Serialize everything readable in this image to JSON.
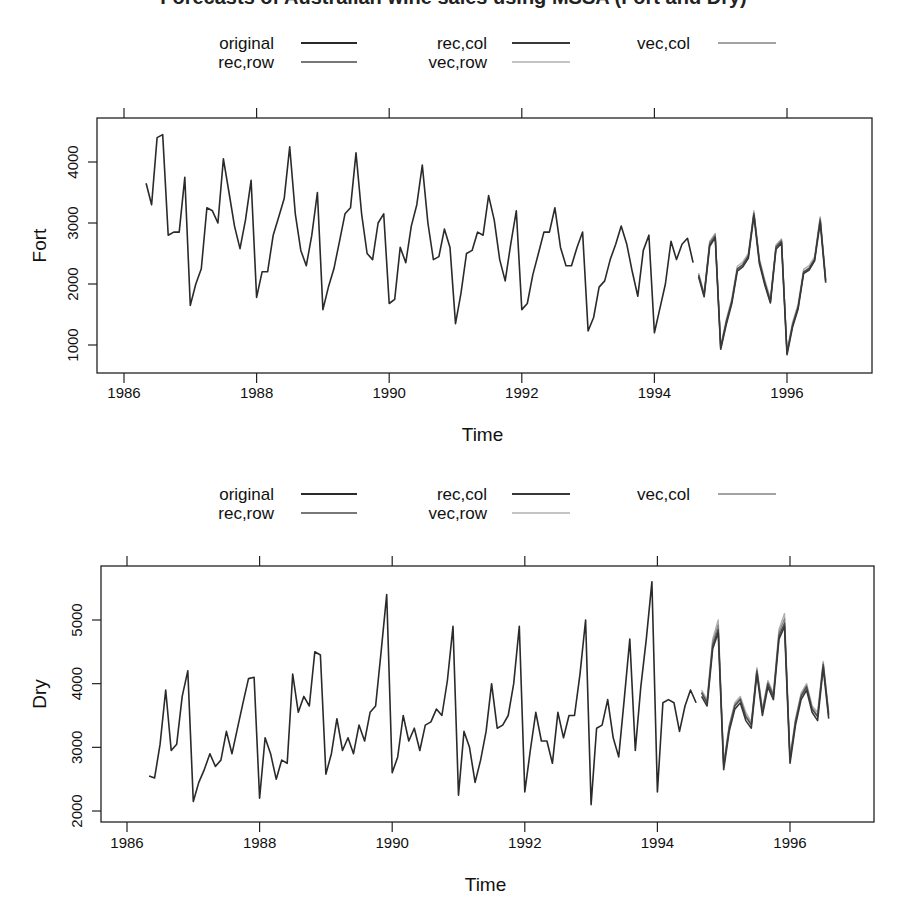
{
  "figure": {
    "title_clipped": "Forecasts of Australian wine sales using MSSA (Fort and Dry)"
  },
  "legend": {
    "entries": [
      {
        "label": "original",
        "color": "#2a2a2a",
        "width": 1.6
      },
      {
        "label": "rec,row",
        "color": "#4a4a4a",
        "width": 1.4
      },
      {
        "label": "rec,col",
        "color": "#383838",
        "width": 1.6
      },
      {
        "label": "vec,row",
        "color": "#b0b0b0",
        "width": 1.4
      },
      {
        "label": "vec,col",
        "color": "#858585",
        "width": 1.4
      }
    ]
  },
  "chart_data": [
    {
      "type": "line",
      "title": "",
      "xlabel": "Time",
      "ylabel": "Fort",
      "xlim": [
        1985.59,
        1997.28
      ],
      "ylim": [
        541,
        4721
      ],
      "x_ticks": [
        1986,
        1988,
        1990,
        1992,
        1994,
        1996
      ],
      "y_ticks": [
        1000,
        2000,
        3000,
        4000
      ],
      "grid": false,
      "legend_position": "top",
      "series": [
        {
          "name": "original",
          "start": 1986.333,
          "step": 0.0833333,
          "values": [
            3650,
            3300,
            4400,
            4450,
            2800,
            2850,
            2850,
            3750,
            1650,
            2000,
            2250,
            3250,
            3200,
            3000,
            4050,
            3500,
            2950,
            2580,
            3050,
            3700,
            1780,
            2200,
            2200,
            2800,
            3100,
            3400,
            4250,
            3150,
            2550,
            2300,
            2800,
            3500,
            1580,
            1950,
            2250,
            2700,
            3150,
            3250,
            4150,
            3150,
            2500,
            2400,
            3000,
            3150,
            1680,
            1750,
            2600,
            2350,
            2950,
            3300,
            3950,
            3000,
            2400,
            2450,
            2900,
            2600,
            1350,
            1850,
            2500,
            2550,
            2850,
            2800,
            3450,
            3050,
            2400,
            2050,
            2650,
            3200,
            1580,
            1680,
            2150,
            2500,
            2850,
            2850,
            3250,
            2600,
            2300,
            2300,
            2600,
            2850,
            1230,
            1450,
            1950,
            2050,
            2400,
            2650,
            2950,
            2650,
            2200,
            1800,
            2550,
            2800,
            1200,
            1600,
            2000,
            2700,
            2400,
            2650,
            2750,
            2350
          ]
        },
        {
          "name": "rec,row",
          "start": 1994.667,
          "step": 0.0833333,
          "values": [
            2150,
            1820,
            2650,
            2780,
            960,
            1380,
            1720,
            2250,
            2320,
            2460,
            3150,
            2380,
            2020,
            1720,
            2600,
            2700,
            870,
            1330,
            1630,
            2200,
            2260,
            2410,
            3050,
            2060
          ]
        },
        {
          "name": "rec,col",
          "start": 1994.667,
          "step": 0.0833333,
          "values": [
            2120,
            1790,
            2620,
            2760,
            930,
            1330,
            1680,
            2210,
            2280,
            2420,
            3120,
            2330,
            1980,
            1690,
            2570,
            2670,
            840,
            1290,
            1590,
            2170,
            2230,
            2380,
            3010,
            2020
          ]
        },
        {
          "name": "vec,row",
          "start": 1994.667,
          "step": 0.0833333,
          "values": [
            2180,
            1850,
            2700,
            2830,
            990,
            1410,
            1760,
            2290,
            2360,
            2500,
            3200,
            2420,
            2060,
            1760,
            2640,
            2740,
            900,
            1370,
            1670,
            2240,
            2300,
            2450,
            3100,
            2100
          ]
        },
        {
          "name": "vec,col",
          "start": 1994.667,
          "step": 0.0833333,
          "values": [
            2140,
            1810,
            2680,
            2810,
            940,
            1360,
            1700,
            2230,
            2300,
            2440,
            3170,
            2360,
            2000,
            1700,
            2620,
            2720,
            860,
            1310,
            1610,
            2190,
            2240,
            2390,
            3080,
            2040
          ]
        }
      ]
    },
    {
      "type": "line",
      "title": "",
      "xlabel": "Time",
      "ylabel": "Dry",
      "xlim": [
        1985.59,
        1997.28
      ],
      "ylim": [
        1827,
        5848
      ],
      "x_ticks": [
        1986,
        1988,
        1990,
        1992,
        1994,
        1996
      ],
      "y_ticks": [
        2000,
        3000,
        4000,
        5000
      ],
      "grid": false,
      "legend_position": "top",
      "series": [
        {
          "name": "original",
          "start": 1986.333,
          "step": 0.0833333,
          "values": [
            2550,
            2520,
            3050,
            3900,
            2950,
            3050,
            3800,
            4200,
            2150,
            2450,
            2650,
            2900,
            2700,
            2800,
            3250,
            2900,
            3300,
            3700,
            4080,
            4100,
            2200,
            3150,
            2900,
            2500,
            2800,
            2750,
            4150,
            3550,
            3800,
            3650,
            4500,
            4450,
            2580,
            2900,
            3450,
            2950,
            3150,
            2900,
            3350,
            3100,
            3550,
            3650,
            4500,
            5400,
            2600,
            2850,
            3500,
            3100,
            3300,
            2950,
            3350,
            3400,
            3600,
            3500,
            4050,
            4900,
            2250,
            3250,
            3000,
            2450,
            2800,
            3250,
            4000,
            3300,
            3350,
            3500,
            4000,
            4900,
            2300,
            2950,
            3550,
            3100,
            3100,
            2750,
            3550,
            3150,
            3500,
            3500,
            4150,
            5000,
            2100,
            3300,
            3350,
            3750,
            3150,
            2850,
            3750,
            4700,
            2950,
            3950,
            4700,
            5600,
            2300,
            3700,
            3750,
            3700,
            3250,
            3650,
            3900,
            3700
          ]
        },
        {
          "name": "rec,row",
          "start": 1994.667,
          "step": 0.0833333,
          "values": [
            3850,
            3700,
            4600,
            4850,
            2700,
            3300,
            3650,
            3750,
            3480,
            3350,
            4200,
            3550,
            4000,
            3800,
            4750,
            4950,
            2800,
            3400,
            3800,
            3950,
            3600,
            3480,
            4300,
            3500
          ]
        },
        {
          "name": "rec,col",
          "start": 1994.667,
          "step": 0.0833333,
          "values": [
            3800,
            3650,
            4550,
            4800,
            2650,
            3250,
            3600,
            3700,
            3420,
            3300,
            4150,
            3500,
            3950,
            3750,
            4700,
            4900,
            2750,
            3350,
            3750,
            3900,
            3550,
            3420,
            4250,
            3450
          ]
        },
        {
          "name": "vec,row",
          "start": 1994.667,
          "step": 0.0833333,
          "values": [
            3900,
            3750,
            4700,
            5000,
            2750,
            3350,
            3700,
            3800,
            3550,
            3400,
            4250,
            3600,
            4050,
            3850,
            4850,
            5100,
            2850,
            3450,
            3850,
            4000,
            3650,
            3550,
            4350,
            3550
          ]
        },
        {
          "name": "vec,col",
          "start": 1994.667,
          "step": 0.0833333,
          "values": [
            3870,
            3720,
            4650,
            4920,
            2720,
            3320,
            3670,
            3770,
            3500,
            3370,
            4220,
            3570,
            4020,
            3820,
            4800,
            5020,
            2820,
            3420,
            3820,
            3970,
            3620,
            3500,
            4320,
            3520
          ]
        }
      ]
    }
  ],
  "panels": [
    {
      "frame": {
        "left": 97,
        "top": 118,
        "right": 872,
        "bottom": 373
      },
      "x_map": {
        "year0": 1986,
        "px0": 124,
        "px_per_year": 66.3
      },
      "y_map": {
        "v0": 4000,
        "py0": 162,
        "px_per_unit": 0.061
      },
      "legend_top": 36,
      "xlabel_y": 441,
      "ticklabel_y": 398,
      "ylabel_x": 46
    },
    {
      "frame": {
        "left": 101,
        "top": 566,
        "right": 874,
        "bottom": 822
      },
      "x_map": {
        "year0": 1986,
        "px0": 127,
        "px_per_year": 66.3
      },
      "y_map": {
        "v0": 5000,
        "py0": 620,
        "px_per_unit": 0.06367
      },
      "legend_top": 487,
      "xlabel_y": 891,
      "ticklabel_y": 848,
      "ylabel_x": 46
    }
  ]
}
